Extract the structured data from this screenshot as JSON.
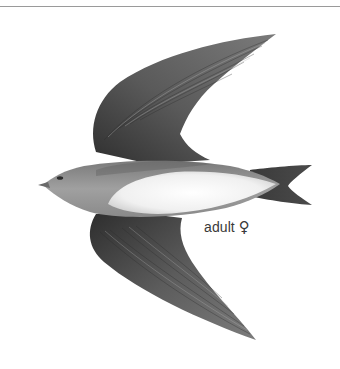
{
  "plate": {
    "subject": "swallow in flight, dorsal view",
    "caption": {
      "age_label": "adult",
      "sex_symbol": "♀"
    }
  },
  "colors": {
    "rule": "#9a9a9a",
    "wing_dark": "#3c3c3c",
    "wing_mid": "#6a6a6a",
    "body_grey": "#8e8e8e",
    "belly_white": "#f4f4f4",
    "caption_text": "#3a3a3a"
  }
}
